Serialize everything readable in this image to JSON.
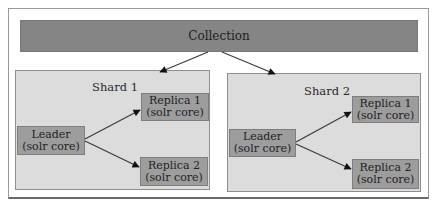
{
  "diagram": {
    "collection": {
      "label": "Collection"
    },
    "shards": [
      {
        "title": "Shard 1",
        "leader": {
          "line1": "Leader",
          "line2": "(solr core)"
        },
        "replicas": [
          {
            "line1": "Replica 1",
            "line2": "(solr core)"
          },
          {
            "line1": "Replica 2",
            "line2": "(solr core)"
          }
        ]
      },
      {
        "title": "Shard 2",
        "leader": {
          "line1": "Leader",
          "line2": "(solr core)"
        },
        "replicas": [
          {
            "line1": "Replica 1",
            "line2": "(solr core)"
          },
          {
            "line1": "Replica 2",
            "line2": "(solr core)"
          }
        ]
      }
    ],
    "edges": [
      {
        "from": "Collection",
        "to": "Shard 1"
      },
      {
        "from": "Collection",
        "to": "Shard 2"
      },
      {
        "from": "Shard 1 Leader",
        "to": "Shard 1 Replica 1"
      },
      {
        "from": "Shard 1 Leader",
        "to": "Shard 1 Replica 2"
      },
      {
        "from": "Shard 2 Leader",
        "to": "Shard 2 Replica 1"
      },
      {
        "from": "Shard 2 Leader",
        "to": "Shard 2 Replica 2"
      }
    ],
    "colors": {
      "collection_fill": "#858585",
      "shard_fill": "#dcdcdc",
      "node_fill": "#9d9d9d",
      "arrow": "#3a3a3a"
    }
  }
}
